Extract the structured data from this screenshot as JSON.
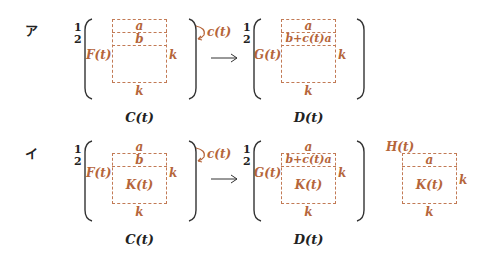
{
  "colors": {
    "accent": "#b5653a",
    "text": "#222222",
    "dash": "#c27a55"
  },
  "rows": [
    {
      "label": "ア",
      "row_numbers": [
        "1",
        "2"
      ],
      "left_matrix": {
        "side_label": "F(t)",
        "rows": [
          "a",
          "b"
        ],
        "inner": "",
        "right_dim": "k",
        "bottom_dim": "k",
        "caption": "C(t)"
      },
      "operation": "c(t)",
      "arrow": "→",
      "right_matrix": {
        "row_numbers": [
          "1",
          "2"
        ],
        "side_label": "G(t)",
        "rows": [
          "a",
          "b+c(t)a"
        ],
        "inner": "",
        "right_dim": "k",
        "bottom_dim": "k",
        "caption": "D(t)"
      }
    },
    {
      "label": "イ",
      "row_numbers": [
        "1",
        "2"
      ],
      "left_matrix": {
        "side_label": "F(t)",
        "rows": [
          "a",
          "b"
        ],
        "inner": "K(t)",
        "right_dim": "k",
        "bottom_dim": "k",
        "caption": "C(t)"
      },
      "operation": "c(t)",
      "arrow": "→",
      "right_matrix": {
        "row_numbers": [
          "1",
          "2"
        ],
        "side_label": "G(t)",
        "rows": [
          "a",
          "b+c(t)a"
        ],
        "inner": "K(t)",
        "right_dim": "k",
        "bottom_dim": "k",
        "caption": "D(t)"
      },
      "extra": {
        "label": "H(t)",
        "rows": [
          "a"
        ],
        "inner": "K(t)",
        "right_dim": "k",
        "bottom_dim": "k"
      }
    }
  ]
}
